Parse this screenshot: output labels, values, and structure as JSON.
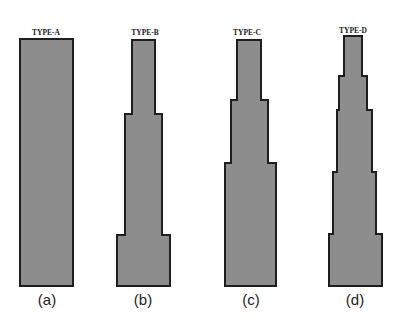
{
  "figure": {
    "colors": {
      "fill": "#8d8d8d",
      "outline": "#1e1e1e",
      "background": "#ffffff"
    },
    "panels": [
      {
        "type_label": "TYPE-A",
        "sub_label": "(a)",
        "points": "20,39 73,39 73,286 20,286"
      },
      {
        "type_label": "TYPE-B",
        "sub_label": "(b)",
        "points": "132,40 155,40 155,114 162,114 162,235 170,235 170,286 117,286 117,235 125,235 125,114 132,114"
      },
      {
        "type_label": "TYPE-C",
        "sub_label": "(c)",
        "points": "237,40 261,40 261,100 268,100 268,163 276,163 276,286 225,286 225,163 231,163 231,100 237,100"
      },
      {
        "type_label": "TYPE-D",
        "sub_label": "(d)",
        "points": "344,36 362,36 362,76 367,76 367,110 372,110 372,172 376,172 376,234 382,234 382,286 329,286 329,234 333,234 333,172 337,172 337,110 339,110 339,76 344,76"
      }
    ]
  }
}
